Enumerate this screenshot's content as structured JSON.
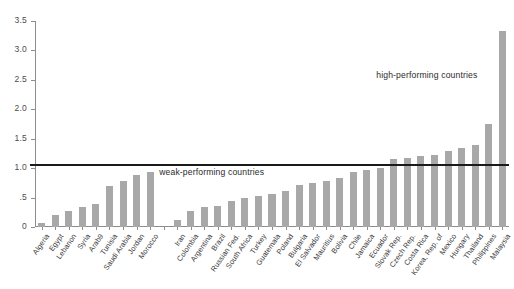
{
  "chart_data": {
    "type": "bar",
    "title": "",
    "subtitle": "",
    "xlabel": "",
    "ylabel": "",
    "ylim": [
      0,
      3.5
    ],
    "yticks": [
      "0",
      ".5",
      "1.0",
      "1.5",
      "2.0",
      "2.5",
      "3.0",
      "3.5"
    ],
    "ytick_values": [
      0,
      0.5,
      1.0,
      1.5,
      2.0,
      2.5,
      3.0,
      3.5
    ],
    "grid": false,
    "legend": "none",
    "bar_color": "#a8a8a8",
    "reference_line": {
      "value": 1.07,
      "color": "#1a1a1a",
      "label": ""
    },
    "annotations": [
      {
        "text": "weak-performing countries",
        "x_frac": 0.262,
        "y_value": 0.92
      },
      {
        "text": "high-performing countries",
        "x_frac": 0.72,
        "y_value": 2.56
      }
    ],
    "groups": [
      {
        "name": "Arab countries",
        "categories": [
          "Algeria",
          "Egypt",
          "Lebanon",
          "Syria",
          "Arab9",
          "Tunisia",
          "Saudi Arabia",
          "Jordan",
          "Morocco"
        ],
        "values": [
          0.07,
          0.2,
          0.28,
          0.34,
          0.39,
          0.7,
          0.78,
          0.89,
          0.94
        ]
      },
      {
        "name": "Comparator countries",
        "categories": [
          "Iran",
          "Colombia",
          "Argentina",
          "Brazil",
          "Russian Fed.",
          "South Africa",
          "Turkey",
          "Guatemala",
          "Poland",
          "Bulgaria",
          "El Salvador",
          "Mauritius",
          "Bolivia",
          "Chile",
          "Jamaica",
          "Ecuador",
          "Slovak Rep.",
          "Czech Rep.",
          "Costa Rica",
          "Korea, Rep. of",
          "Mexico",
          "Hungary",
          "Thailand",
          "Philippines",
          "Malaysia"
        ],
        "values": [
          0.12,
          0.28,
          0.34,
          0.36,
          0.44,
          0.49,
          0.52,
          0.56,
          0.62,
          0.72,
          0.74,
          0.78,
          0.84,
          0.94,
          0.97,
          1.0,
          1.15,
          1.17,
          1.2,
          1.22,
          1.3,
          1.34,
          1.4,
          1.75,
          3.33
        ]
      }
    ]
  }
}
